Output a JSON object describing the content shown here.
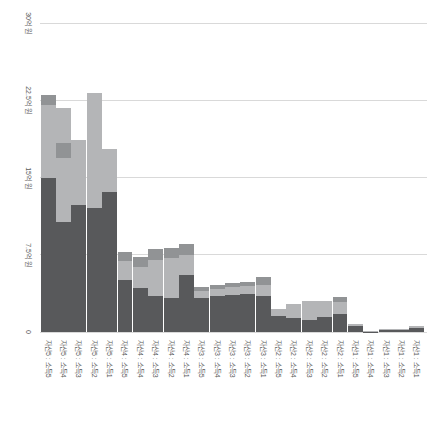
{
  "chart_data": {
    "type": "bar",
    "stacked": true,
    "orientation": "vertical",
    "title": "",
    "xlabel": "",
    "ylabel": "",
    "unit": "억 원",
    "grid": true,
    "legend": false,
    "tick_label_rotation_deg": 90,
    "background_color": "#ffffff",
    "gridline_color": "#d9d9d9",
    "tick_text_color": "#595959",
    "ylim": [
      0,
      30
    ],
    "categories": [
      "자산5 : 소득5",
      "자산5 : 소득4",
      "자산5 : 소득3",
      "자산5 : 소득2",
      "자산5 : 소득1",
      "자산4 : 소득5",
      "자산4 : 소득4",
      "자산4 : 소득3",
      "자산4 : 소득2",
      "자산4 : 소득1",
      "자산3 : 소득5",
      "자산3 : 소득4",
      "자산3 : 소득3",
      "자산3 : 소득2",
      "자산3 : 소득1",
      "자산2 : 소득5",
      "자산2 : 소득4",
      "자산2 : 소득3",
      "자산2 : 소득2",
      "자산2 : 소득1",
      "자산1 : 소득5",
      "자산1 : 소득4",
      "자산1 : 소득3",
      "자산1 : 소득2",
      "자산1 : 소득1"
    ],
    "series": [
      {
        "name": "dark-gray-bottom-segment",
        "color": "#58595b",
        "values": [
          14.95,
          10.7,
          12.33,
          12.04,
          13.62,
          5.08,
          4.27,
          3.5,
          3.27,
          5.53,
          3.3,
          3.47,
          3.62,
          3.69,
          3.47,
          1.52,
          1.36,
          1.19,
          1.43,
          1.75,
          0.55,
          0.04,
          0.2,
          0.22,
          0.39
        ]
      },
      {
        "name": "light-gray-middle-segment",
        "color": "#b4b5b7",
        "values": [
          7.1,
          6.2,
          6.31,
          11.17,
          4.15,
          1.79,
          2.04,
          3.5,
          3.88,
          1.94,
          0.68,
          0.7,
          0.78,
          0.81,
          1.12,
          0.74,
          1.36,
          1.85,
          1.61,
          1.16,
          0.26,
          0.04,
          0.11,
          0.12,
          0.22
        ]
      },
      {
        "name": "medium-gray-cap-segment",
        "color": "#919395",
        "values": [
          0.97,
          1.47,
          0,
          0,
          0,
          0.87,
          0.97,
          1.04,
          0.97,
          1.07,
          0.36,
          0.36,
          0.33,
          0.32,
          0.78,
          0,
          0,
          0,
          0,
          0.46,
          0,
          0,
          0,
          0,
          0
        ]
      },
      {
        "name": "light-gray-top-segment",
        "color": "#b4b5b7",
        "values": [
          0,
          3.4,
          0,
          0,
          0,
          0,
          0,
          0,
          0,
          0,
          0,
          0,
          0,
          0,
          0,
          0,
          0,
          0,
          0,
          0,
          0,
          0,
          0,
          0,
          0
        ]
      }
    ],
    "y_axis": {
      "ticks": [
        {
          "label": "0",
          "value": 0
        },
        {
          "label": "7.5억 원",
          "value": 7.5
        },
        {
          "label": "15억 원",
          "value": 15
        },
        {
          "label": "22.5억 원",
          "value": 22.5
        },
        {
          "label": "30억 원",
          "value": 30
        }
      ]
    }
  }
}
